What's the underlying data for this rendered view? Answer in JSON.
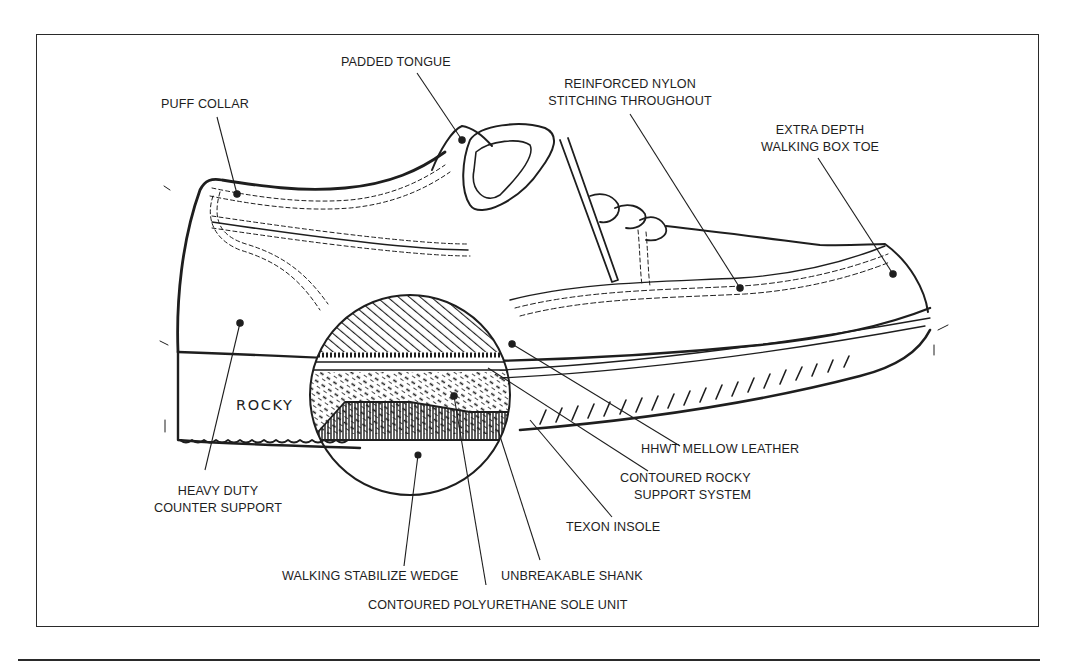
{
  "diagram": {
    "brand_mark": "ROCKY",
    "ink_color": "#1e1e1e",
    "background_color": "#ffffff",
    "callouts": [
      {
        "id": "padded-tongue",
        "lines": [
          "PADDED TONGUE"
        ]
      },
      {
        "id": "puff-collar",
        "lines": [
          "PUFF COLLAR"
        ]
      },
      {
        "id": "reinforced-nylon",
        "lines": [
          "REINFORCED NYLON",
          "STITCHING THROUGHOUT"
        ]
      },
      {
        "id": "extra-depth",
        "lines": [
          "EXTRA DEPTH",
          "WALKING BOX TOE"
        ]
      },
      {
        "id": "heavy-duty",
        "lines": [
          "HEAVY DUTY",
          "COUNTER SUPPORT"
        ]
      },
      {
        "id": "hhwt-leather",
        "lines": [
          "HHWT MELLOW LEATHER"
        ]
      },
      {
        "id": "contoured-rocky",
        "lines": [
          "CONTOURED ROCKY",
          "SUPPORT SYSTEM"
        ]
      },
      {
        "id": "texon-insole",
        "lines": [
          "TEXON INSOLE"
        ]
      },
      {
        "id": "walking-wedge",
        "lines": [
          "WALKING STABILIZE WEDGE"
        ]
      },
      {
        "id": "unbreakable-shank",
        "lines": [
          "UNBREAKABLE SHANK"
        ]
      },
      {
        "id": "pu-sole",
        "lines": [
          "CONTOURED POLYURETHANE SOLE UNIT"
        ]
      }
    ]
  }
}
